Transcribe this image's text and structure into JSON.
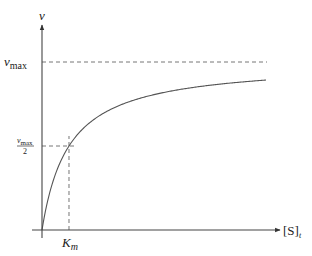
{
  "chart_data": {
    "type": "line",
    "title": "",
    "xlabel": "[S]_t",
    "ylabel": "v",
    "model": "michaelis-menten",
    "parameters": {
      "vmax": 1.0,
      "Km": 1.0
    },
    "xlim": [
      0,
      8.3
    ],
    "ylim": [
      0,
      1.0
    ],
    "series": [
      {
        "name": "v",
        "x": [
          0,
          0.25,
          0.5,
          1,
          1.5,
          2,
          3,
          4,
          5,
          6,
          7,
          8.3
        ],
        "values": [
          0,
          0.2,
          0.333,
          0.5,
          0.6,
          0.667,
          0.75,
          0.8,
          0.833,
          0.857,
          0.875,
          0.892
        ]
      }
    ],
    "reference_lines": [
      {
        "name": "vmax-line",
        "orientation": "horizontal",
        "value": 1.0,
        "label": "v_max",
        "style": "dashed"
      },
      {
        "name": "half-vmax-line",
        "orientation": "horizontal",
        "value": 0.5,
        "label": "v_max/2",
        "style": "dashed"
      },
      {
        "name": "km-line",
        "orientation": "vertical",
        "value": 1.0,
        "label": "K_m",
        "style": "dashed"
      }
    ],
    "labels": {
      "y_axis": "v",
      "x_axis_main": "[S]",
      "x_axis_sub": "t",
      "vmax_main": "v",
      "vmax_sub": "max",
      "half_num_main": "v",
      "half_num_sub": "max",
      "half_den": "2",
      "km_main": "K",
      "km_sub": "m"
    },
    "grid": false,
    "legend": "none",
    "colors": {
      "axis": "#444444",
      "curve": "#555555",
      "dash": "#666666"
    }
  }
}
